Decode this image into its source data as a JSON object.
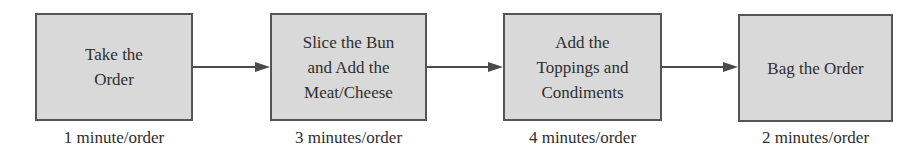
{
  "diagram": {
    "type": "process-flow",
    "steps": [
      {
        "label": "Take the\nOrder",
        "time": "1 minute/order"
      },
      {
        "label": "Slice the Bun\nand Add the\nMeat/Cheese",
        "time": "3 minutes/order"
      },
      {
        "label": "Add the\nToppings and\nCondiments",
        "time": "4 minutes/order"
      },
      {
        "label": "Bag the Order",
        "time": "2 minutes/order"
      }
    ],
    "connections": [
      {
        "from": 0,
        "to": 1
      },
      {
        "from": 1,
        "to": 2
      },
      {
        "from": 2,
        "to": 3
      }
    ],
    "colors": {
      "box_fill": "#d9d9d9",
      "box_border": "#555555",
      "arrow": "#4a4a4a",
      "text": "#2e2e2e"
    }
  }
}
